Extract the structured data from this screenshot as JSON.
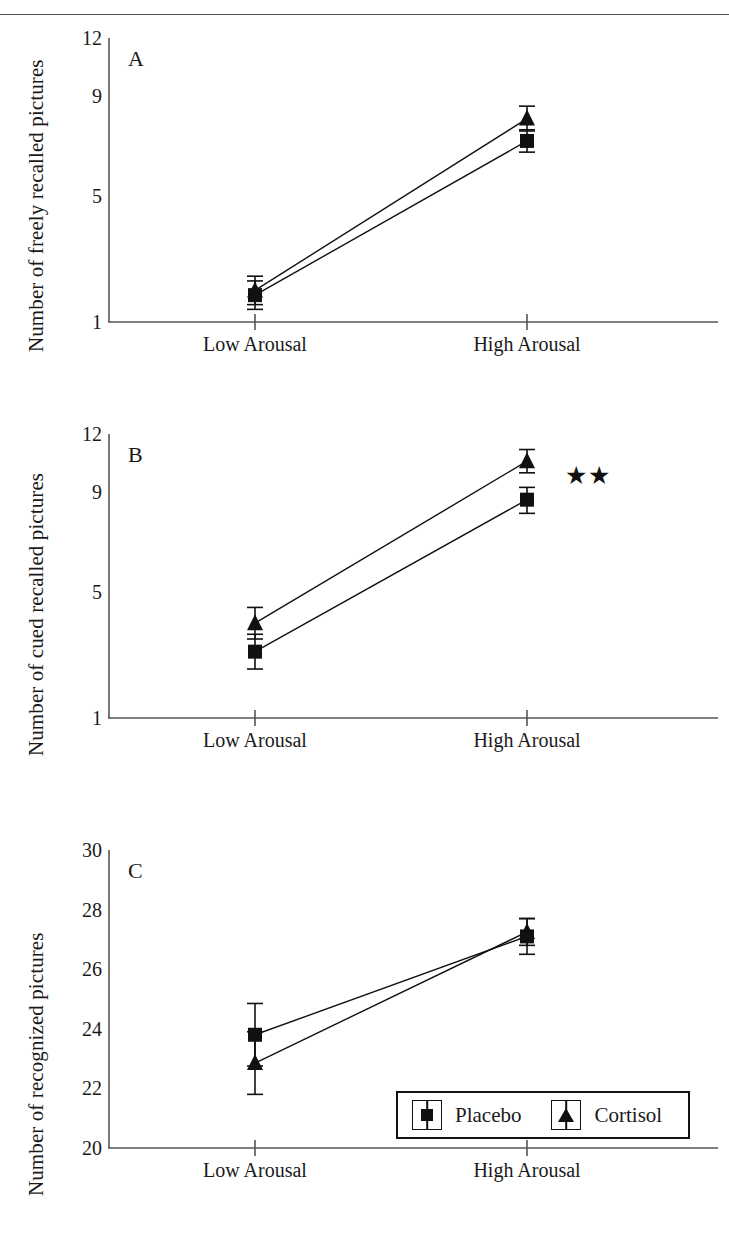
{
  "figure": {
    "header_ghost": "",
    "x_categories": [
      "Low Arousal",
      "High Arousal"
    ],
    "legend": {
      "placebo_label": "Placebo",
      "cortisol_label": "Cortisol",
      "placebo_marker": "square-marker-icon",
      "cortisol_marker": "triangle-marker-icon"
    },
    "marker_color": "#111111",
    "line_color": "#111111",
    "axis_color": "#555555"
  },
  "chart_data": [
    {
      "type": "line",
      "panel": "A",
      "panel_letter": "A",
      "title": "",
      "xlabel": "",
      "ylabel": "Number of freely recalled pictures",
      "categories": [
        "Low Arousal",
        "High Arousal"
      ],
      "yticks": [
        12,
        9,
        5,
        1
      ],
      "ylim": [
        1,
        12
      ],
      "grid": false,
      "legend_position": "none",
      "annotations": [],
      "series": [
        {
          "name": "Placebo",
          "marker": "square",
          "values": [
            1.85,
            7.2
          ],
          "errors": [
            0.45,
            0.45
          ]
        },
        {
          "name": "Cortisol",
          "marker": "triangle",
          "values": [
            2.0,
            8.1
          ],
          "errors": [
            0.45,
            0.5
          ]
        }
      ]
    },
    {
      "type": "line",
      "panel": "B",
      "panel_letter": "B",
      "title": "",
      "xlabel": "",
      "ylabel": "Number of cued recalled pictures",
      "categories": [
        "Low Arousal",
        "High Arousal"
      ],
      "yticks": [
        12,
        9,
        5,
        1
      ],
      "ylim": [
        1,
        12
      ],
      "grid": false,
      "legend_position": "none",
      "annotations": [
        {
          "text": "★★",
          "near": "High Arousal",
          "meaning": "significance-marker"
        }
      ],
      "series": [
        {
          "name": "Placebo",
          "marker": "square",
          "values": [
            3.1,
            8.7
          ],
          "errors": [
            0.55,
            0.55
          ]
        },
        {
          "name": "Cortisol",
          "marker": "triangle",
          "values": [
            4.0,
            10.6
          ],
          "errors": [
            0.5,
            0.6
          ]
        }
      ]
    },
    {
      "type": "line",
      "panel": "C",
      "panel_letter": "C",
      "title": "",
      "xlabel": "",
      "ylabel": "Number of recognized pictures",
      "categories": [
        "Low Arousal",
        "High Arousal"
      ],
      "yticks": [
        30,
        28,
        26,
        24,
        22,
        20
      ],
      "ylim": [
        20,
        30
      ],
      "grid": false,
      "legend_position": "inside-bottom-right",
      "annotations": [],
      "series": [
        {
          "name": "Placebo",
          "marker": "square",
          "values": [
            23.8,
            27.1
          ],
          "errors": [
            1.05,
            0.6
          ]
        },
        {
          "name": "Cortisol",
          "marker": "triangle",
          "values": [
            22.85,
            27.25
          ],
          "errors": [
            1.05,
            0.45
          ]
        }
      ]
    }
  ]
}
